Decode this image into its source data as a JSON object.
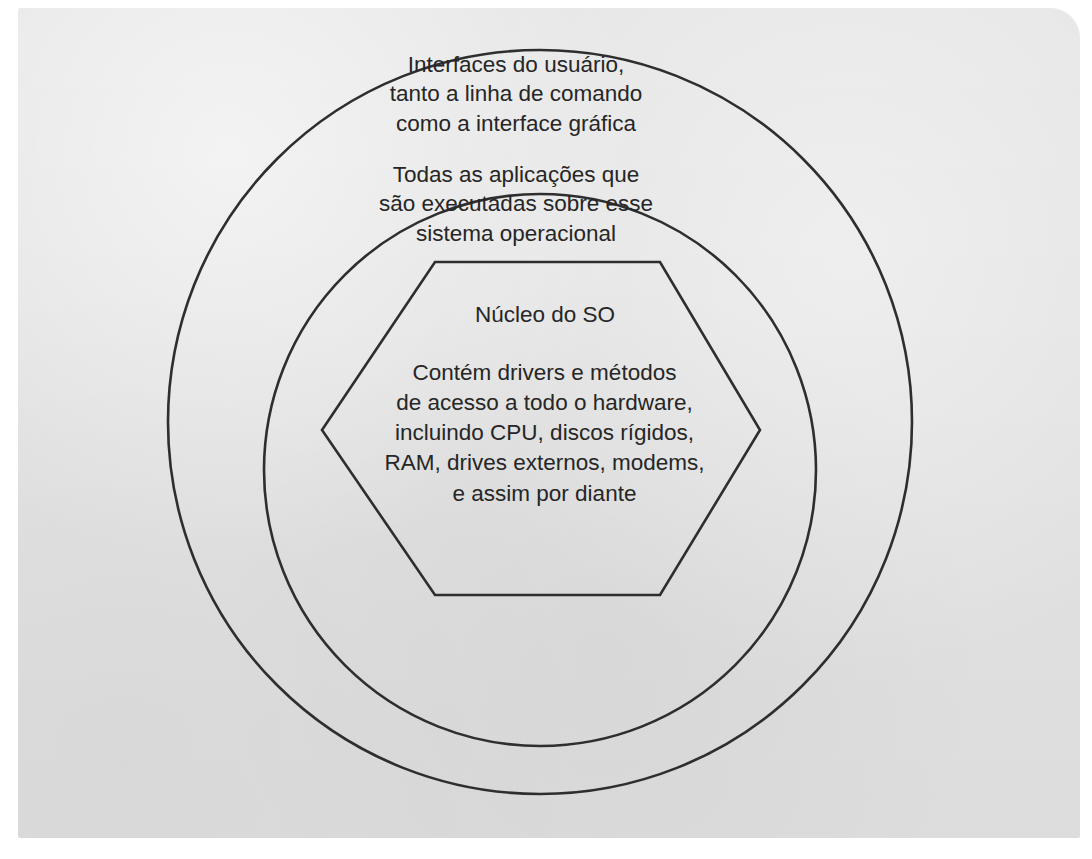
{
  "page": {
    "background_color": "#e1e1e1",
    "paper_color": "#ffffff",
    "ink_color": "#2e2e2e",
    "text_color": "#262626"
  },
  "diagram": {
    "type": "concentric-layers",
    "layers": [
      {
        "name": "outer-ring",
        "shape": "circle",
        "label": "Interfaces do usuário,\ntanto a linha de comando\ncomo a interface gráfica"
      },
      {
        "name": "middle-ring",
        "shape": "circle",
        "label": "Todas as aplicações que\nsão executadas sobre esse\nsistema operacional"
      },
      {
        "name": "kernel-core",
        "shape": "hexagon",
        "title": "Núcleo do SO",
        "label": "Contém drivers e métodos\nde acesso a todo o hardware,\nincluindo CPU, discos rígidos,\nRAM, drives externos, modems,\ne assim por diante"
      }
    ]
  },
  "bleed_through": {
    "note": "faint reverse-side show-through, illegible",
    "heading": "",
    "lines": [
      "",
      "",
      "",
      "",
      "",
      "",
      "",
      "",
      "",
      ""
    ]
  },
  "bottom_fragment": ""
}
